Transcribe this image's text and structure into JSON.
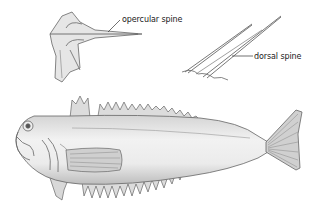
{
  "figure": {
    "labels": {
      "opercular_spine": "opercular spine",
      "dorsal_spine": "dorsal spine"
    },
    "colors": {
      "background": "#ffffff",
      "line": "#555555",
      "shade": "#c9c9c9",
      "text": "#1a1a1a"
    }
  }
}
